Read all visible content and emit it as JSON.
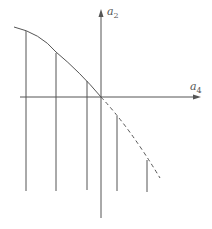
{
  "diagram": {
    "axes": {
      "vertical_label": "a",
      "vertical_subscript": "2",
      "horizontal_label": "a",
      "horizontal_subscript": "4"
    },
    "colors": {
      "line": "#555555",
      "background": "#ffffff"
    },
    "curve": {
      "solid_segment": "from upper-left down to origin",
      "dashed_segment": "continuation below horizontal axis to lower-right"
    },
    "vertical_lines_count": 5
  }
}
